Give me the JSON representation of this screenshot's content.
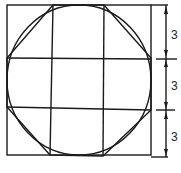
{
  "diagram": {
    "square": {
      "x": 7,
      "y": 5,
      "w": 144,
      "h": 150
    },
    "grid_x": [
      52,
      104
    ],
    "grid_y": [
      58,
      108
    ],
    "circle": {
      "cx": 79,
      "cy": 80,
      "rx": 72,
      "ry": 75
    },
    "dimensions": [
      {
        "label": "3",
        "y1": 5,
        "y2": 58
      },
      {
        "label": "3",
        "y1": 58,
        "y2": 110
      },
      {
        "label": "3",
        "y1": 110,
        "y2": 157
      }
    ],
    "colors": {
      "line": "#1a1a1a",
      "background": "#ffffff"
    }
  }
}
